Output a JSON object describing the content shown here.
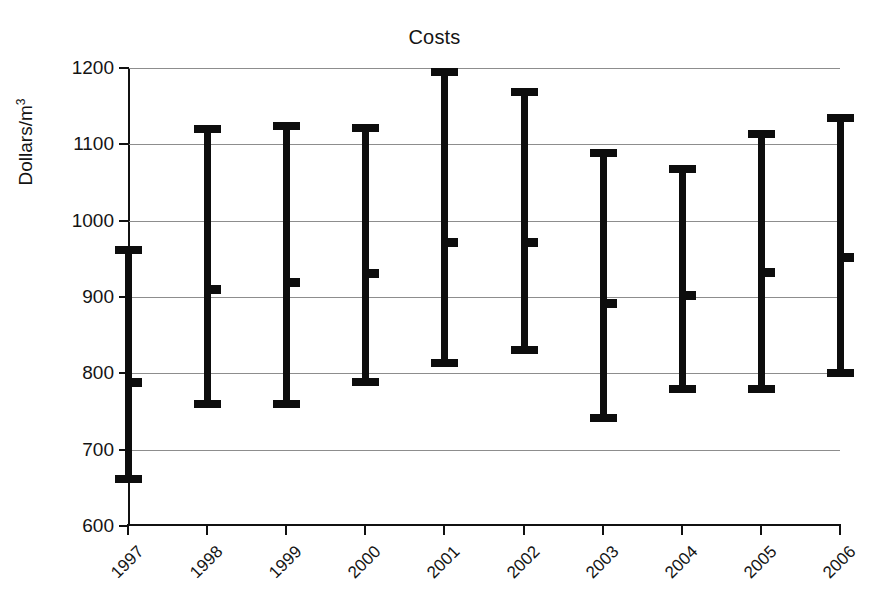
{
  "chart_data": {
    "type": "bar",
    "title": "Costs",
    "xlabel": "",
    "ylabel": "Dollars/m3",
    "ylabel_base": "Dollars/m",
    "ylabel_sup": "3",
    "categories": [
      "1997",
      "1998",
      "1999",
      "2000",
      "2001",
      "2002",
      "2003",
      "2004",
      "2005",
      "2006"
    ],
    "ylim": [
      600,
      1200
    ],
    "yticks": [
      600,
      700,
      800,
      900,
      1000,
      1100,
      1200
    ],
    "ytick_labels": [
      "600",
      "700",
      "800",
      "900",
      "1000",
      "1100",
      "1200"
    ],
    "grid": true,
    "legend": "none",
    "series": [
      {
        "name": "Cost range (low / mid / high)",
        "low": [
          662,
          760,
          760,
          789,
          813,
          831,
          741,
          780,
          779,
          800
        ],
        "mid": [
          789,
          911,
          920,
          932,
          972,
          972,
          892,
          902,
          933,
          953
        ],
        "high": [
          961,
          1120,
          1124,
          1122,
          1195,
          1169,
          1088,
          1068,
          1113,
          1135
        ]
      }
    ],
    "points": [
      {
        "year": "1997",
        "low": 662,
        "mid": 789,
        "high": 961
      },
      {
        "year": "1998",
        "low": 760,
        "mid": 911,
        "high": 1120
      },
      {
        "year": "1999",
        "low": 760,
        "mid": 920,
        "high": 1124
      },
      {
        "year": "2000",
        "low": 789,
        "mid": 932,
        "high": 1122
      },
      {
        "year": "2001",
        "low": 813,
        "mid": 972,
        "high": 1195
      },
      {
        "year": "2002",
        "low": 831,
        "mid": 972,
        "high": 1169
      },
      {
        "year": "2003",
        "low": 741,
        "mid": 892,
        "high": 1088
      },
      {
        "year": "2004",
        "low": 780,
        "mid": 902,
        "high": 1068
      },
      {
        "year": "2005",
        "low": 779,
        "mid": 933,
        "high": 1113
      },
      {
        "year": "2006",
        "low": 800,
        "mid": 953,
        "high": 1135
      }
    ],
    "colors": {
      "marker": "#0d0d0d",
      "axis": "#111111",
      "grid": "#8d8d8d",
      "background": "#ffffff",
      "text": "#141414"
    }
  }
}
